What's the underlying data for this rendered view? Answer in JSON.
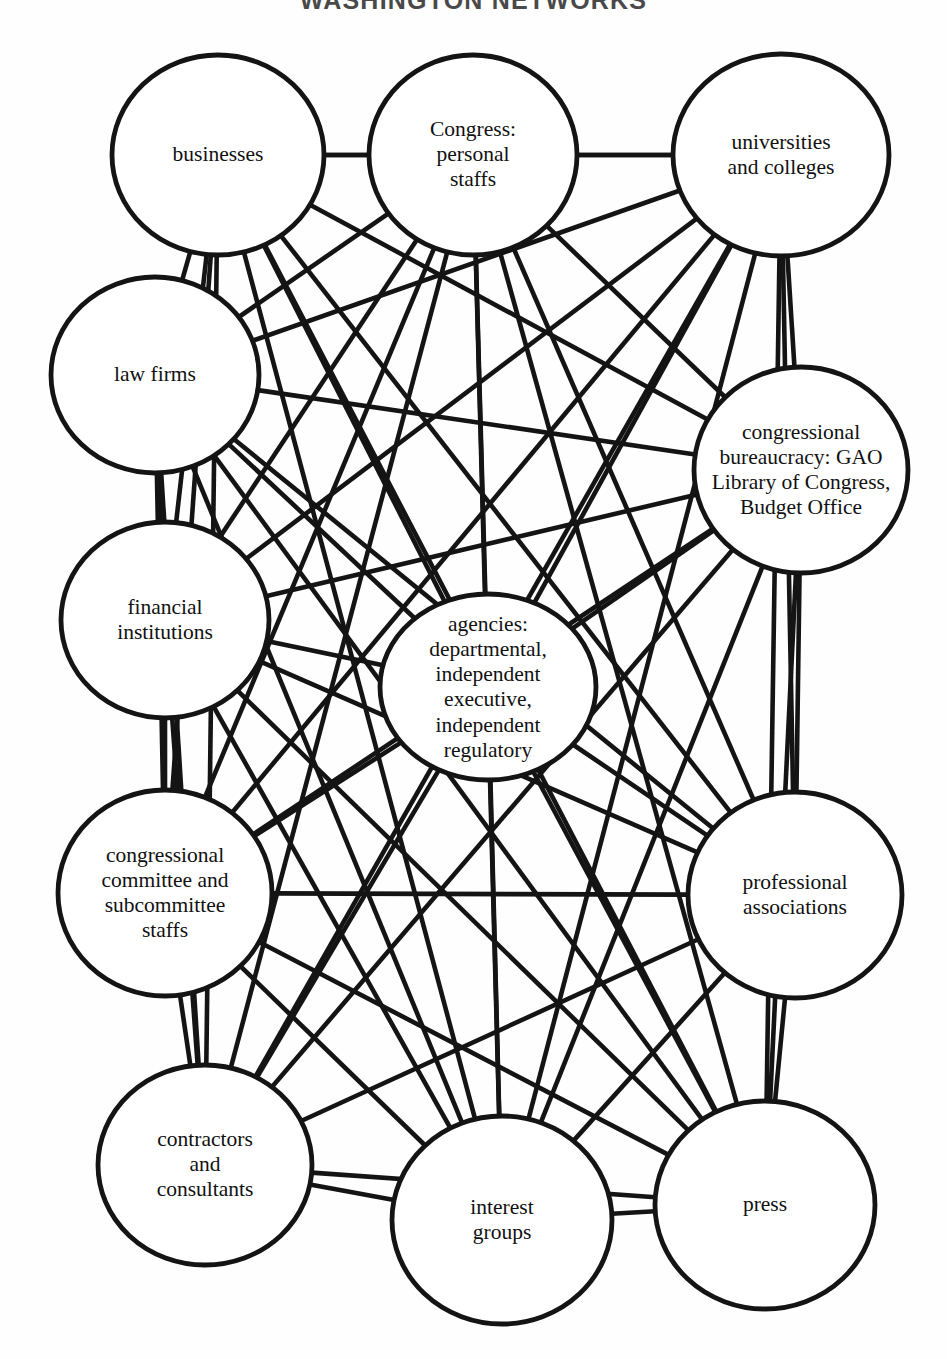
{
  "title": "WASHINGTON NETWORKS",
  "canvas": {
    "width": 947,
    "height": 1359,
    "background": "#fefefe"
  },
  "style": {
    "edge_color": "#141414",
    "edge_width": 4.6,
    "node_stroke": "#141414",
    "node_fill": "#ffffff",
    "node_stroke_width": 4.8,
    "label_color": "#111111"
  },
  "chart_data": {
    "type": "network-diagram",
    "title": "WASHINGTON NETWORKS",
    "node_count": 12,
    "layout": "ring with one central hub",
    "nodes": [
      {
        "id": "businesses",
        "label": "businesses",
        "cx": 218,
        "cy": 155,
        "rx": 106,
        "ry": 100
      },
      {
        "id": "congress",
        "label": "Congress:\npersonal\nstaffs",
        "cx": 473,
        "cy": 155,
        "rx": 104,
        "ry": 100
      },
      {
        "id": "universities",
        "label": "universities\nand colleges",
        "cx": 781,
        "cy": 155,
        "rx": 108,
        "ry": 101
      },
      {
        "id": "law_firms",
        "label": "law firms",
        "cx": 155,
        "cy": 375,
        "rx": 104,
        "ry": 98
      },
      {
        "id": "cong_bureaucracy",
        "label": "congressional\nbureaucracy: GAO\nLibrary of Congress,\nBudget Office",
        "cx": 801,
        "cy": 470,
        "rx": 107,
        "ry": 103
      },
      {
        "id": "financial",
        "label": "financial\ninstitutions",
        "cx": 165,
        "cy": 620,
        "rx": 104,
        "ry": 98
      },
      {
        "id": "agencies",
        "label": "agencies:\ndepartmental,\nindependent\nexecutive,\nindependent\nregulatory",
        "cx": 488,
        "cy": 687,
        "rx": 108,
        "ry": 93
      },
      {
        "id": "cong_committees",
        "label": "congressional\ncommittee and\nsubcommittee\nstaffs",
        "cx": 165,
        "cy": 893,
        "rx": 107,
        "ry": 103
      },
      {
        "id": "prof_assoc",
        "label": "professional\nassociations",
        "cx": 795,
        "cy": 895,
        "rx": 107,
        "ry": 103
      },
      {
        "id": "contractors",
        "label": "contractors\nand\nconsultants",
        "cx": 205,
        "cy": 1165,
        "rx": 107,
        "ry": 100
      },
      {
        "id": "interest_groups",
        "label": "interest\ngroups",
        "cx": 502,
        "cy": 1220,
        "rx": 110,
        "ry": 104
      },
      {
        "id": "press",
        "label": "press",
        "cx": 765,
        "cy": 1205,
        "rx": 110,
        "ry": 104
      }
    ],
    "edges": [
      [
        "businesses",
        "congress"
      ],
      [
        "businesses",
        "universities"
      ],
      [
        "businesses",
        "law_firms"
      ],
      [
        "businesses",
        "cong_bureaucracy"
      ],
      [
        "businesses",
        "financial"
      ],
      [
        "businesses",
        "agencies"
      ],
      [
        "businesses",
        "cong_committees"
      ],
      [
        "businesses",
        "prof_assoc"
      ],
      [
        "businesses",
        "contractors"
      ],
      [
        "businesses",
        "interest_groups"
      ],
      [
        "businesses",
        "press"
      ],
      [
        "congress",
        "universities"
      ],
      [
        "congress",
        "law_firms"
      ],
      [
        "congress",
        "cong_bureaucracy"
      ],
      [
        "congress",
        "financial"
      ],
      [
        "congress",
        "agencies"
      ],
      [
        "congress",
        "cong_committees"
      ],
      [
        "congress",
        "prof_assoc"
      ],
      [
        "congress",
        "contractors"
      ],
      [
        "congress",
        "interest_groups"
      ],
      [
        "congress",
        "press"
      ],
      [
        "universities",
        "law_firms"
      ],
      [
        "universities",
        "cong_bureaucracy"
      ],
      [
        "universities",
        "financial"
      ],
      [
        "universities",
        "agencies"
      ],
      [
        "universities",
        "cong_committees"
      ],
      [
        "universities",
        "prof_assoc"
      ],
      [
        "universities",
        "contractors"
      ],
      [
        "universities",
        "interest_groups"
      ],
      [
        "universities",
        "press"
      ],
      [
        "law_firms",
        "cong_bureaucracy"
      ],
      [
        "law_firms",
        "financial"
      ],
      [
        "law_firms",
        "agencies"
      ],
      [
        "law_firms",
        "cong_committees"
      ],
      [
        "law_firms",
        "prof_assoc"
      ],
      [
        "law_firms",
        "contractors"
      ],
      [
        "law_firms",
        "interest_groups"
      ],
      [
        "law_firms",
        "press"
      ],
      [
        "cong_bureaucracy",
        "financial"
      ],
      [
        "cong_bureaucracy",
        "agencies"
      ],
      [
        "cong_bureaucracy",
        "cong_committees"
      ],
      [
        "cong_bureaucracy",
        "prof_assoc"
      ],
      [
        "cong_bureaucracy",
        "contractors"
      ],
      [
        "cong_bureaucracy",
        "interest_groups"
      ],
      [
        "cong_bureaucracy",
        "press"
      ],
      [
        "financial",
        "agencies"
      ],
      [
        "financial",
        "cong_committees"
      ],
      [
        "financial",
        "prof_assoc"
      ],
      [
        "financial",
        "contractors"
      ],
      [
        "financial",
        "interest_groups"
      ],
      [
        "financial",
        "press"
      ],
      [
        "agencies",
        "cong_committees"
      ],
      [
        "agencies",
        "prof_assoc"
      ],
      [
        "agencies",
        "contractors"
      ],
      [
        "agencies",
        "interest_groups"
      ],
      [
        "agencies",
        "press"
      ],
      [
        "cong_committees",
        "prof_assoc"
      ],
      [
        "cong_committees",
        "contractors"
      ],
      [
        "cong_committees",
        "interest_groups"
      ],
      [
        "cong_committees",
        "press"
      ],
      [
        "prof_assoc",
        "contractors"
      ],
      [
        "prof_assoc",
        "interest_groups"
      ],
      [
        "prof_assoc",
        "press"
      ],
      [
        "contractors",
        "interest_groups"
      ],
      [
        "contractors",
        "press"
      ],
      [
        "interest_groups",
        "press"
      ]
    ]
  }
}
